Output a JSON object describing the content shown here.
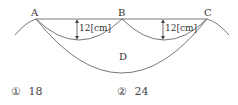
{
  "diagram": {
    "points": {
      "A": "A",
      "B": "B",
      "C": "C",
      "D": "D"
    },
    "dimension_left": "12[cm]",
    "dimension_right": "12[cm]"
  },
  "choices": [
    {
      "marker": "①",
      "value": "18"
    },
    {
      "marker": "②",
      "value": "24"
    }
  ]
}
